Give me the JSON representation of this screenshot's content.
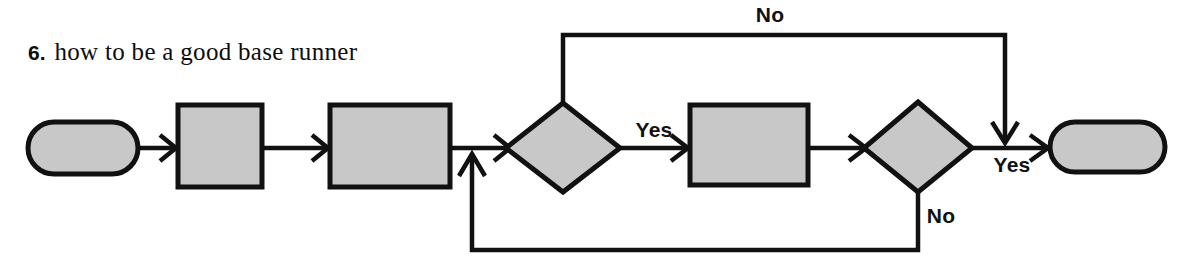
{
  "title": {
    "number": "6.",
    "text": "how to be a good base runner"
  },
  "colors": {
    "shape_fill": "#c8c8c8",
    "stroke": "#111111",
    "background": "#ffffff",
    "text": "#0d0d0d"
  },
  "diagram": {
    "type": "flowchart",
    "orientation": "left-to-right",
    "nodes": [
      {
        "id": "start",
        "shape": "terminator",
        "label": ""
      },
      {
        "id": "proc1",
        "shape": "process",
        "label": ""
      },
      {
        "id": "proc2",
        "shape": "process",
        "label": ""
      },
      {
        "id": "merge",
        "shape": "junction",
        "label": ""
      },
      {
        "id": "dec1",
        "shape": "decision",
        "label": ""
      },
      {
        "id": "proc3",
        "shape": "process",
        "label": ""
      },
      {
        "id": "dec2",
        "shape": "decision",
        "label": ""
      },
      {
        "id": "end",
        "shape": "terminator",
        "label": ""
      }
    ],
    "edges": [
      {
        "from": "start",
        "to": "proc1",
        "label": ""
      },
      {
        "from": "proc1",
        "to": "proc2",
        "label": ""
      },
      {
        "from": "proc2",
        "to": "dec1",
        "label": ""
      },
      {
        "from": "dec1",
        "to": "proc3",
        "label": "Yes"
      },
      {
        "from": "dec1",
        "to": "end",
        "label": "No"
      },
      {
        "from": "proc3",
        "to": "dec2",
        "label": ""
      },
      {
        "from": "dec2",
        "to": "end",
        "label": "Yes"
      },
      {
        "from": "dec2",
        "to": "merge",
        "label": "No"
      }
    ],
    "labels": {
      "no_top": "No",
      "yes_mid": "Yes",
      "yes_right": "Yes",
      "no_bottom": "No"
    }
  }
}
